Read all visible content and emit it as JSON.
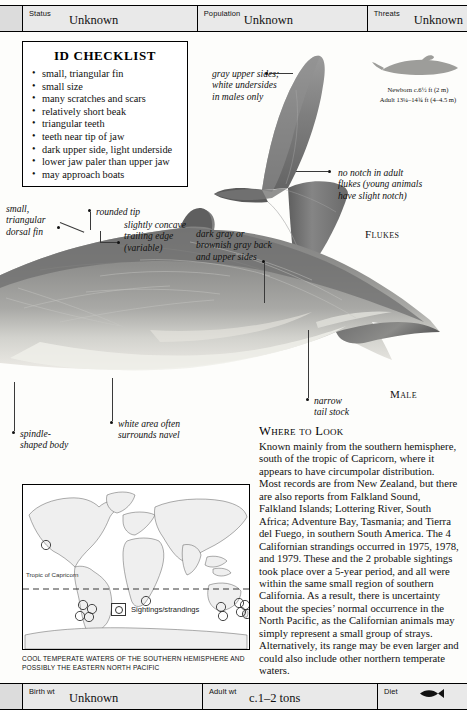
{
  "top_bar": {
    "fields": [
      {
        "key": "Status",
        "value": "Unknown"
      },
      {
        "key": "Population",
        "value": "Unknown"
      },
      {
        "key": "Threats",
        "value": "Unknown"
      }
    ]
  },
  "bottom_bar": {
    "fields": [
      {
        "key": "Birth wt",
        "value": "Unknown"
      },
      {
        "key": "Adult wt",
        "value": "c.1–2 tons"
      },
      {
        "key": "Diet",
        "value": ""
      }
    ],
    "diet_icon": "fish-icon"
  },
  "checklist": {
    "title": "ID CHECKLIST",
    "items": [
      "small, triangular fin",
      "small size",
      "many scratches and scars",
      "relatively short beak",
      "triangular teeth",
      "teeth near tip of jaw",
      "dark upper side, light underside",
      "lower jaw paler than upper jaw",
      "may approach boats"
    ]
  },
  "size_block": {
    "newborn": "Newborn c.6½ ft (2 m)",
    "adult": "Adult 13¼–14¾ ft (4–4.5 m)",
    "silhouette": "dolphin-silhouette"
  },
  "annotations": {
    "gray_upper": "gray upper sides;\nwhite undersides\nin males only",
    "no_notch": "no notch in adult\nflukes (young animals\nhave slight notch)",
    "dorsal_fin": "small,\ntriangular\ndorsal fin",
    "rounded_tip": "rounded tip",
    "trailing_edge": "slightly concave\ntrailing edge\n(variable)",
    "dark_gray": "dark gray or\nbrownish gray back\nand upper sides",
    "narrow_tail": "narrow\ntail stock",
    "spindle": "spindle-\nshaped body",
    "white_area": "white area often\nsurrounds navel"
  },
  "captions": {
    "flukes": "Flukes",
    "male": "Male"
  },
  "where_to_look": {
    "heading": "Where to Look",
    "body": "Known mainly from the southern hemisphere, south of the tropic of Capricorn, where it appears to have circumpolar distribution. Most records are from New Zealand, but there are also reports from Falkland Sound, Falkland Islands; Lottering River, South Africa; Adventure Bay, Tasmania; and Tierra del Fuego, in southern South America. The 4 Californian strandings occurred in 1975, 1978, and 1979. These and the 2 probable sightings took place over a 5-year period, and all were within the same small region of southern California. As a result, there is uncertainty about the species’ normal occurrence in the North Pacific, as the Californian animals may simply represent a small group of strays. Alternatively, its range may be even larger and could also include other northern temperate waters."
  },
  "map": {
    "tropic_label": "Tropic of Capricorn",
    "legend_label": "Sightings/strandings",
    "caption": "COOL TEMPERATE WATERS OF THE SOUTHERN HEMISPHERE AND POSSIBLY THE  EASTERN NORTH PACIFIC"
  },
  "colors": {
    "bar_bg": "#e9e9e9",
    "body_dark": "#6d6d6d",
    "body_mid": "#8a8a8a",
    "body_light": "#d9d9d6",
    "ink": "#111111"
  }
}
